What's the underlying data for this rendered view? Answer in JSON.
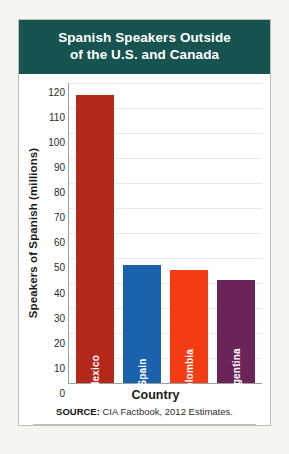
{
  "header": {
    "title_line1": "Spanish Speakers Outside",
    "title_line2": "of the U.S. and Canada",
    "background_color": "#17534f",
    "text_color": "#ffffff"
  },
  "source": {
    "label": "SOURCE:",
    "text": "CIA Factbook, 2012 Estimates."
  },
  "chart_data": {
    "type": "bar",
    "title": "Spanish Speakers Outside of the U.S. and Canada",
    "xlabel": "Country",
    "ylabel": "Speakers of Spanish (millions)",
    "categories": [
      "Mexico",
      "Spain",
      "Colombia",
      "Argentina"
    ],
    "values": [
      115,
      47,
      45,
      41
    ],
    "colors": [
      "#b4281c",
      "#1b62ad",
      "#f43c14",
      "#6b2458"
    ],
    "ylim": [
      0,
      120
    ],
    "ytick_step": 10,
    "yticks": [
      120,
      110,
      100,
      90,
      80,
      70,
      60,
      50,
      40,
      30,
      20,
      10,
      0
    ],
    "grid": true,
    "legend": "none"
  }
}
